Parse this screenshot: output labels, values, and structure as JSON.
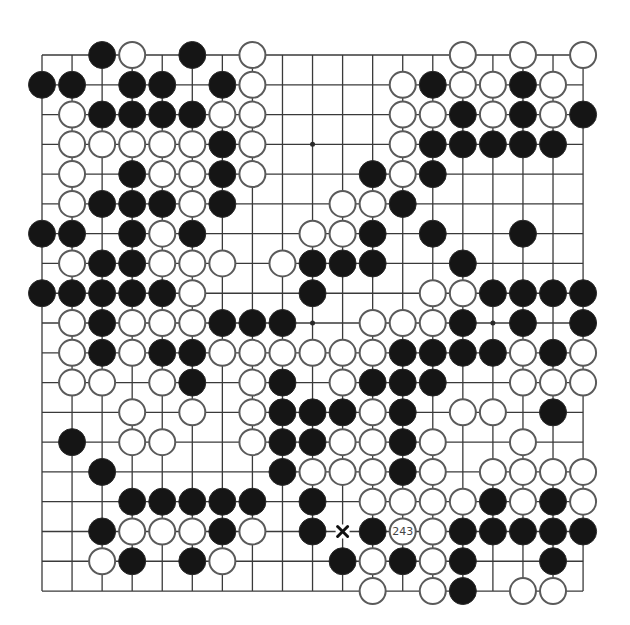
{
  "board": {
    "size": 19,
    "origin_x": 42,
    "origin_y": 55,
    "spacing_x": 30.06,
    "spacing_y": 29.78,
    "stone_radius": 13.5,
    "colors": {
      "background": "#ffffff",
      "line": "#3a3a3a",
      "black_stone": "#151515",
      "white_stone": "#ffffff",
      "white_outline": "#5a5a5a"
    },
    "star_points": [
      [
        3,
        3
      ],
      [
        3,
        9
      ],
      [
        3,
        15
      ],
      [
        9,
        3
      ],
      [
        9,
        9
      ],
      [
        9,
        15
      ],
      [
        15,
        3
      ],
      [
        15,
        9
      ],
      [
        15,
        15
      ]
    ],
    "rows": [
      {
        "row": 0,
        "black": [
          2,
          5
        ],
        "white": [
          3,
          7,
          14,
          16,
          18
        ]
      },
      {
        "row": 1,
        "black": [
          0,
          1,
          3,
          4,
          6,
          13,
          16
        ],
        "white": [
          7,
          12,
          14,
          15,
          17
        ]
      },
      {
        "row": 2,
        "black": [
          2,
          3,
          4,
          5,
          14,
          16,
          18
        ],
        "white": [
          1,
          6,
          7,
          12,
          13,
          15,
          17
        ]
      },
      {
        "row": 3,
        "black": [
          6,
          13,
          14,
          15,
          16,
          17
        ],
        "white": [
          1,
          2,
          3,
          4,
          5,
          7,
          12
        ]
      },
      {
        "row": 4,
        "black": [
          3,
          6,
          11,
          13
        ],
        "white": [
          1,
          4,
          5,
          7,
          12
        ]
      },
      {
        "row": 5,
        "black": [
          2,
          3,
          4,
          6,
          12
        ],
        "white": [
          1,
          5,
          10,
          11
        ]
      },
      {
        "row": 6,
        "black": [
          0,
          1,
          3,
          5,
          11,
          13,
          16
        ],
        "white": [
          4,
          9,
          10
        ]
      },
      {
        "row": 7,
        "black": [
          2,
          3,
          9,
          10,
          11,
          14
        ],
        "white": [
          1,
          4,
          5,
          6,
          8
        ]
      },
      {
        "row": 8,
        "black": [
          0,
          1,
          2,
          3,
          4,
          9,
          15,
          16,
          17,
          18
        ],
        "white": [
          5,
          13,
          14
        ]
      },
      {
        "row": 9,
        "black": [
          2,
          6,
          7,
          8,
          14,
          16,
          18
        ],
        "white": [
          1,
          3,
          4,
          5,
          11,
          12,
          13
        ]
      },
      {
        "row": 10,
        "black": [
          2,
          4,
          5,
          12,
          13,
          14,
          15,
          17
        ],
        "white": [
          1,
          3,
          6,
          7,
          8,
          9,
          10,
          11,
          16,
          18
        ]
      },
      {
        "row": 11,
        "black": [
          5,
          8,
          11,
          12,
          13
        ],
        "white": [
          1,
          2,
          4,
          7,
          10,
          16,
          17,
          18
        ]
      },
      {
        "row": 12,
        "black": [
          8,
          9,
          10,
          12,
          17
        ],
        "white": [
          3,
          5,
          7,
          11,
          14,
          15
        ]
      },
      {
        "row": 13,
        "black": [
          1,
          8,
          9,
          12
        ],
        "white": [
          3,
          4,
          7,
          10,
          11,
          13,
          16
        ]
      },
      {
        "row": 14,
        "black": [
          2,
          8,
          12
        ],
        "white": [
          9,
          10,
          11,
          13,
          15,
          16,
          17,
          18
        ]
      },
      {
        "row": 15,
        "black": [
          3,
          4,
          5,
          6,
          7,
          9,
          15,
          17
        ],
        "white": [
          11,
          12,
          13,
          14,
          16,
          18
        ]
      },
      {
        "row": 16,
        "black": [
          2,
          6,
          9,
          11,
          14,
          15,
          16,
          17,
          18
        ],
        "white": [
          3,
          4,
          5,
          7,
          12,
          13
        ]
      },
      {
        "row": 17,
        "black": [
          3,
          5,
          10,
          12,
          14,
          17
        ],
        "white": [
          2,
          6,
          11,
          13
        ]
      },
      {
        "row": 18,
        "black": [
          14
        ],
        "white": [
          11,
          13,
          16,
          17
        ]
      }
    ],
    "labels": [
      {
        "row": 16,
        "col": 12,
        "text": "243",
        "on": "white"
      }
    ],
    "markers": [
      {
        "row": 16,
        "col": 10,
        "type": "x-mark"
      }
    ]
  }
}
